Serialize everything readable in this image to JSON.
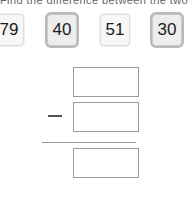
{
  "instruction": {
    "text": "Find the difference between the two numbers."
  },
  "tiles": {
    "items": [
      {
        "value": "79",
        "style": "light"
      },
      {
        "value": "40",
        "style": "gray"
      },
      {
        "value": "51",
        "style": "light"
      },
      {
        "value": "30",
        "style": "gray"
      }
    ]
  },
  "worksheet": {
    "operator": "−",
    "minuend": "",
    "subtrahend": "",
    "result": ""
  },
  "colors": {
    "tile_light_fill": "#f7f7f7",
    "tile_light_border": "#dedede",
    "tile_gray_fill": "#ededed",
    "tile_gray_border": "#b9b9b9",
    "box_border": "#9a9a9a",
    "text": "#1a1a1a",
    "rule": "#9a9a9a",
    "page_background": "#ffffff"
  }
}
